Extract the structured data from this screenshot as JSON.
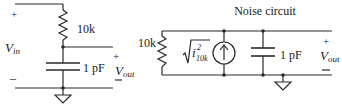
{
  "left_circuit": {
    "input_plus": "+",
    "input_label": "V",
    "input_sub": "in",
    "input_minus": "–",
    "resistor_label": "10k",
    "capacitor_label": "1 pF",
    "output_plus": "+",
    "output_label": "V",
    "output_sub": "out",
    "output_minus": "–"
  },
  "right_circuit": {
    "title": "Noise circuit",
    "resistor_label": "10k",
    "noise_source_label": {
      "symbol": "i",
      "superscript": "2",
      "subscript": "10k"
    },
    "current_source_icon": "current-source-up-arrow",
    "capacitor_label": "1 pF",
    "output_plus": "+",
    "output_label": "V",
    "output_sub": "out",
    "output_minus": "–"
  },
  "colors": {
    "line": "#2a2a2a",
    "text": "#222222",
    "background": "#ffffff"
  }
}
